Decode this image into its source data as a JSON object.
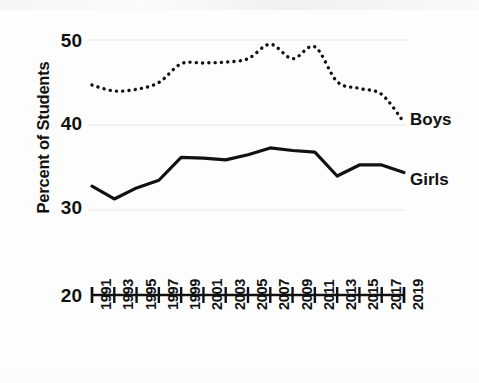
{
  "chart_data": {
    "type": "line",
    "title": "",
    "xlabel": "",
    "ylabel": "Percent of Students",
    "ylim": [
      20,
      50
    ],
    "yticks": [
      20,
      30,
      40,
      50
    ],
    "ytick_labels": [
      "20",
      "30",
      "40",
      "50"
    ],
    "xlim": [
      1991,
      2019
    ],
    "grid": "horizontal-faint",
    "legend_position": "right-inline-end-of-line",
    "x": [
      1991,
      1993,
      1995,
      1997,
      1999,
      2001,
      2003,
      2005,
      2007,
      2009,
      2011,
      2013,
      2015,
      2017,
      2019
    ],
    "xtick_labels": [
      "1991",
      "1993",
      "1995",
      "1997",
      "1999",
      "2001",
      "2003",
      "2005",
      "2007",
      "2009",
      "2011",
      "2013",
      "2015",
      "2017",
      "2019"
    ],
    "series": [
      {
        "name": "Boys",
        "style": "dotted",
        "color": "#111111",
        "values": [
          44.7,
          44.0,
          44.2,
          45.0,
          47.2,
          47.3,
          47.4,
          47.8,
          49.5,
          47.8,
          49.2,
          45.1,
          44.3,
          43.6,
          40.3
        ]
      },
      {
        "name": "Girls",
        "style": "solid",
        "color": "#111111",
        "values": [
          32.8,
          31.3,
          32.6,
          33.5,
          36.2,
          36.1,
          35.9,
          36.5,
          37.3,
          37.0,
          36.8,
          34.0,
          35.3,
          35.3,
          34.4
        ]
      }
    ]
  },
  "axis": {
    "y_title": "Percent of Students",
    "y_ticks": [
      "50",
      "40",
      "30",
      "20"
    ]
  },
  "labels": {
    "boys": "Boys",
    "girls": "Girls"
  }
}
